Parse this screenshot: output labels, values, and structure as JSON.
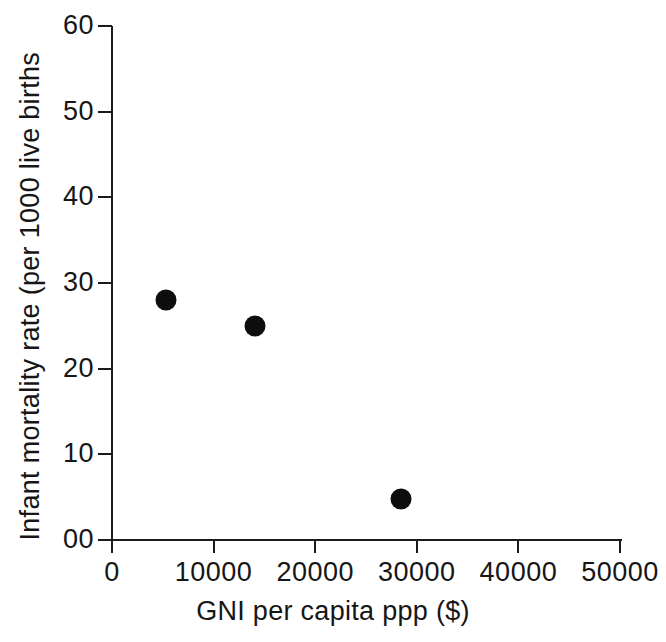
{
  "chart_data": {
    "type": "scatter",
    "title": "",
    "xlabel": "GNI per capita ppp ($)",
    "ylabel": "Infant mortality rate (per 1000 live births",
    "xlim": [
      0,
      50000
    ],
    "ylim": [
      0,
      60
    ],
    "grid": false,
    "legend": null,
    "x_ticks": [
      {
        "value": 0,
        "label": "0"
      },
      {
        "value": 10000,
        "label": "10000"
      },
      {
        "value": 20000,
        "label": "20000"
      },
      {
        "value": 30000,
        "label": "30000"
      },
      {
        "value": 40000,
        "label": "40000"
      },
      {
        "value": 50000,
        "label": "50000"
      }
    ],
    "y_ticks": [
      {
        "value": 60,
        "label": "60"
      },
      {
        "value": 50,
        "label": "50"
      },
      {
        "value": 40,
        "label": "40"
      },
      {
        "value": 30,
        "label": "30"
      },
      {
        "value": 20,
        "label": "20"
      },
      {
        "value": 10,
        "label": "10"
      },
      {
        "value": 0,
        "label": "00"
      }
    ],
    "marker": {
      "shape": "circle",
      "color": "#0d0d0d",
      "size_px": 21
    },
    "axis_color": "#1b1b1b",
    "points": [
      {
        "x": 5300,
        "y": 28.0
      },
      {
        "x": 14100,
        "y": 25.0
      },
      {
        "x": 28400,
        "y": 4.8
      }
    ]
  }
}
